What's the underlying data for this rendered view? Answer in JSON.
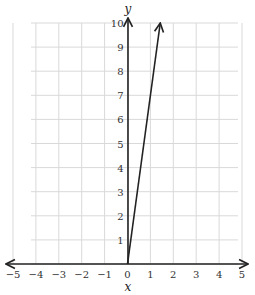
{
  "chart_data": {
    "type": "line",
    "title": "",
    "xlabel": "x",
    "ylabel": "y",
    "xlim": [
      -5,
      5
    ],
    "ylim": [
      0,
      10
    ],
    "grid": true,
    "x_ticks": [
      "-5",
      "-4",
      "-3",
      "-2",
      "-1",
      "0",
      "1",
      "2",
      "3",
      "4",
      "5"
    ],
    "y_ticks": [
      "1",
      "2",
      "3",
      "4",
      "5",
      "6",
      "7",
      "8",
      "9",
      "10"
    ],
    "series": [
      {
        "name": "line",
        "equation": "y = 7x",
        "x": [
          0,
          1.43
        ],
        "y": [
          0,
          10
        ],
        "arrow_end": true
      }
    ]
  },
  "labels": {
    "x_axis": "x",
    "y_axis": "y"
  },
  "colors": {
    "grid": "#d9d9d9",
    "axis": "#222222",
    "line": "#222222"
  }
}
